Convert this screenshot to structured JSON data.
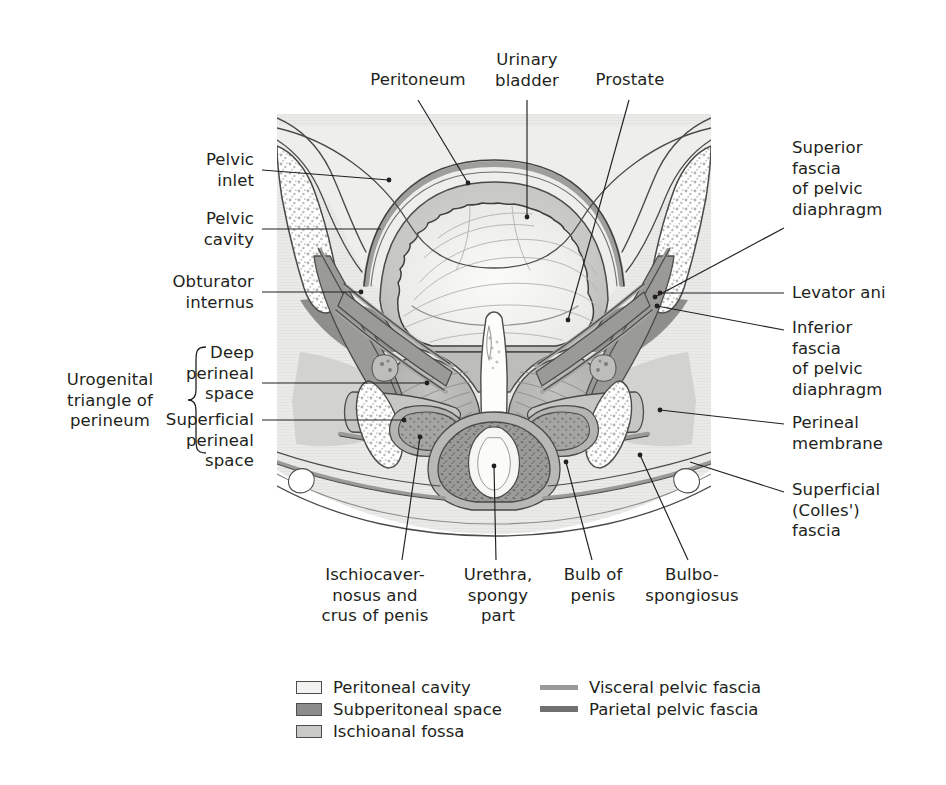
{
  "figure": {
    "kind": "anatomical-illustration",
    "background": "#ffffff",
    "ink": "#231f20"
  },
  "labels": {
    "top": [
      {
        "id": "peritoneum",
        "text": "Peritoneum"
      },
      {
        "id": "urinary-bladder",
        "text": "Urinary\nbladder"
      },
      {
        "id": "prostate",
        "text": "Prostate"
      }
    ],
    "left": [
      {
        "id": "pelvic-inlet",
        "text": "Pelvic\ninlet"
      },
      {
        "id": "pelvic-cavity",
        "text": "Pelvic\ncavity"
      },
      {
        "id": "obturator-internus",
        "text": "Obturator\ninternus"
      },
      {
        "id": "deep-perineal-space",
        "text": "Deep\nperineal\nspace"
      },
      {
        "id": "superficial-perineal-space",
        "text": "Superficial\nperineal\nspace"
      }
    ],
    "left_bracket": {
      "id": "urogenital-triangle",
      "text": "Urogenital\ntriangle of\nperineum"
    },
    "right": [
      {
        "id": "superior-fascia-pelvic-diaphragm",
        "text": "Superior\nfascia\nof pelvic\ndiaphragm"
      },
      {
        "id": "levator-ani",
        "text": "Levator ani"
      },
      {
        "id": "inferior-fascia-pelvic-diaphragm",
        "text": "Inferior\nfascia\nof pelvic\ndiaphragm"
      },
      {
        "id": "perineal-membrane",
        "text": "Perineal\nmembrane"
      },
      {
        "id": "superficial-colles-fascia",
        "text": "Superficial\n(Colles')\nfascia"
      }
    ],
    "bottom": [
      {
        "id": "ischiocavernosus-crus-penis",
        "text": "Ischiocaver-\nnosus and\ncrus of penis"
      },
      {
        "id": "urethra-spongy-part",
        "text": "Urethra,\nspongy\npart"
      },
      {
        "id": "bulb-of-penis",
        "text": "Bulb of\npenis"
      },
      {
        "id": "bulbospongiosus",
        "text": "Bulbo-\nspongiosus"
      }
    ]
  },
  "legend": {
    "swatches": [
      {
        "id": "peritoneal-cavity",
        "text": "Peritoneal cavity",
        "fill": "#f2f2f0",
        "stroke": "#4d4d4d"
      },
      {
        "id": "subperitoneal-space",
        "text": "Subperitoneal space",
        "fill": "#8c8c8c",
        "stroke": "#4d4d4d"
      },
      {
        "id": "ischioanal-fossa",
        "text": "Ischioanal fossa",
        "fill": "#c9c9c6",
        "stroke": "#4d4d4d"
      }
    ],
    "lines": [
      {
        "id": "visceral-pelvic-fascia",
        "text": "Visceral pelvic fascia",
        "color": "#9a9a9a",
        "thickness": "5px"
      },
      {
        "id": "parietal-pelvic-fascia",
        "text": "Parietal pelvic fascia",
        "color": "#707070",
        "thickness": "6px"
      }
    ]
  }
}
